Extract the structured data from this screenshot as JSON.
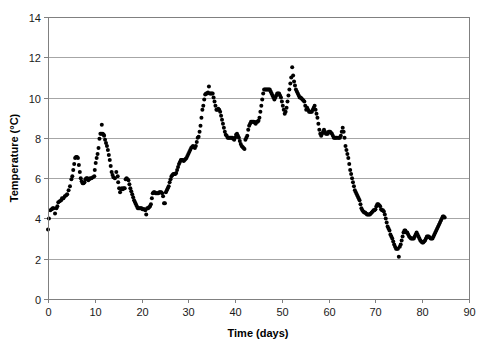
{
  "chart_data": {
    "type": "scatter",
    "title": "",
    "xlabel": "Time (days)",
    "ylabel": "Temperature (°C)",
    "xlim": [
      0,
      90
    ],
    "ylim": [
      0,
      14
    ],
    "x_ticks": [
      0,
      10,
      20,
      30,
      40,
      50,
      60,
      70,
      80,
      90
    ],
    "y_ticks": [
      0,
      2,
      4,
      6,
      8,
      10,
      12,
      14
    ],
    "x_tick_labels": [
      "0",
      "10",
      "20",
      "30",
      "40",
      "50",
      "60",
      "70",
      "80",
      "90"
    ],
    "y_tick_labels": [
      "0",
      "2",
      "4",
      "6",
      "8",
      "10",
      "12",
      "14"
    ],
    "grid": "horizontal",
    "legend": null,
    "marker": "filled-circle",
    "marker_color": "#000000",
    "marker_size": 2.0,
    "series_name": "Temperature",
    "points": [
      [
        0.0,
        3.45
      ],
      [
        0.2,
        4.0
      ],
      [
        0.5,
        4.4
      ],
      [
        0.8,
        4.45
      ],
      [
        1.0,
        4.5
      ],
      [
        1.2,
        4.5
      ],
      [
        1.5,
        4.25
      ],
      [
        1.8,
        4.5
      ],
      [
        2.0,
        4.6
      ],
      [
        2.2,
        4.8
      ],
      [
        2.5,
        4.85
      ],
      [
        2.8,
        4.9
      ],
      [
        3.0,
        5.0
      ],
      [
        3.3,
        5.0
      ],
      [
        3.6,
        5.1
      ],
      [
        3.9,
        5.15
      ],
      [
        4.1,
        5.2
      ],
      [
        4.4,
        5.4
      ],
      [
        4.7,
        5.6
      ],
      [
        5.0,
        5.95
      ],
      [
        5.2,
        6.1
      ],
      [
        5.4,
        6.4
      ],
      [
        5.6,
        6.7
      ],
      [
        5.8,
        7.0
      ],
      [
        6.0,
        7.05
      ],
      [
        6.2,
        7.05
      ],
      [
        6.4,
        7.0
      ],
      [
        6.6,
        6.65
      ],
      [
        6.8,
        6.3
      ],
      [
        7.0,
        6.0
      ],
      [
        7.2,
        5.85
      ],
      [
        7.4,
        5.75
      ],
      [
        7.6,
        5.75
      ],
      [
        7.8,
        5.8
      ],
      [
        8.0,
        5.95
      ],
      [
        8.2,
        6.0
      ],
      [
        8.4,
        6.0
      ],
      [
        8.6,
        5.9
      ],
      [
        8.8,
        5.95
      ],
      [
        9.0,
        6.0
      ],
      [
        9.3,
        6.0
      ],
      [
        9.6,
        6.05
      ],
      [
        9.9,
        6.1
      ],
      [
        10.0,
        6.4
      ],
      [
        10.2,
        6.75
      ],
      [
        10.4,
        7.0
      ],
      [
        10.6,
        7.2
      ],
      [
        10.8,
        7.5
      ],
      [
        11.0,
        7.95
      ],
      [
        11.2,
        8.2
      ],
      [
        11.4,
        8.2
      ],
      [
        11.5,
        8.65
      ],
      [
        11.7,
        8.2
      ],
      [
        11.9,
        8.15
      ],
      [
        12.0,
        8.1
      ],
      [
        12.2,
        7.9
      ],
      [
        12.4,
        7.75
      ],
      [
        12.6,
        7.6
      ],
      [
        12.8,
        7.4
      ],
      [
        13.0,
        7.15
      ],
      [
        13.2,
        6.9
      ],
      [
        13.4,
        6.6
      ],
      [
        13.6,
        6.3
      ],
      [
        13.8,
        6.15
      ],
      [
        14.0,
        6.05
      ],
      [
        14.3,
        6.0
      ],
      [
        14.6,
        6.3
      ],
      [
        14.9,
        6.1
      ],
      [
        15.0,
        5.8
      ],
      [
        15.2,
        5.5
      ],
      [
        15.4,
        5.3
      ],
      [
        15.6,
        5.45
      ],
      [
        15.8,
        5.5
      ],
      [
        16.0,
        5.45
      ],
      [
        16.2,
        5.5
      ],
      [
        16.4,
        5.5
      ],
      [
        16.6,
        5.95
      ],
      [
        16.8,
        6.0
      ],
      [
        17.0,
        5.95
      ],
      [
        17.2,
        5.9
      ],
      [
        17.4,
        5.7
      ],
      [
        17.6,
        5.5
      ],
      [
        17.8,
        5.35
      ],
      [
        18.0,
        5.2
      ],
      [
        18.2,
        5.05
      ],
      [
        18.4,
        4.9
      ],
      [
        18.6,
        4.8
      ],
      [
        18.8,
        4.7
      ],
      [
        19.0,
        4.6
      ],
      [
        19.2,
        4.5
      ],
      [
        19.4,
        4.5
      ],
      [
        19.6,
        4.5
      ],
      [
        19.8,
        4.5
      ],
      [
        20.0,
        4.5
      ],
      [
        20.2,
        4.45
      ],
      [
        20.4,
        4.45
      ],
      [
        20.6,
        4.45
      ],
      [
        20.8,
        4.4
      ],
      [
        21.0,
        4.2
      ],
      [
        21.2,
        4.5
      ],
      [
        21.4,
        4.5
      ],
      [
        21.6,
        4.55
      ],
      [
        21.8,
        4.6
      ],
      [
        22.0,
        4.7
      ],
      [
        22.2,
        5.0
      ],
      [
        22.4,
        5.25
      ],
      [
        22.6,
        5.3
      ],
      [
        22.8,
        5.3
      ],
      [
        23.0,
        5.25
      ],
      [
        23.2,
        5.25
      ],
      [
        23.4,
        5.25
      ],
      [
        23.6,
        5.25
      ],
      [
        23.8,
        5.3
      ],
      [
        24.0,
        5.3
      ],
      [
        24.2,
        5.3
      ],
      [
        24.4,
        5.25
      ],
      [
        24.6,
        5.1
      ],
      [
        24.8,
        4.75
      ],
      [
        25.0,
        4.75
      ],
      [
        25.2,
        5.3
      ],
      [
        25.4,
        5.4
      ],
      [
        25.6,
        5.5
      ],
      [
        25.8,
        5.6
      ],
      [
        26.0,
        5.8
      ],
      [
        26.2,
        5.95
      ],
      [
        26.4,
        6.1
      ],
      [
        26.6,
        6.15
      ],
      [
        26.8,
        6.2
      ],
      [
        27.0,
        6.2
      ],
      [
        27.2,
        6.2
      ],
      [
        27.4,
        6.25
      ],
      [
        27.6,
        6.4
      ],
      [
        27.8,
        6.55
      ],
      [
        28.0,
        6.7
      ],
      [
        28.2,
        6.8
      ],
      [
        28.4,
        6.9
      ],
      [
        28.6,
        6.9
      ],
      [
        28.8,
        6.9
      ],
      [
        29.0,
        6.85
      ],
      [
        29.2,
        6.9
      ],
      [
        29.4,
        6.95
      ],
      [
        29.6,
        7.0
      ],
      [
        29.8,
        7.1
      ],
      [
        30.0,
        7.2
      ],
      [
        30.2,
        7.3
      ],
      [
        30.4,
        7.4
      ],
      [
        30.6,
        7.5
      ],
      [
        30.8,
        7.55
      ],
      [
        31.0,
        7.6
      ],
      [
        31.2,
        7.55
      ],
      [
        31.4,
        7.5
      ],
      [
        31.6,
        7.6
      ],
      [
        31.8,
        7.8
      ],
      [
        32.0,
        8.0
      ],
      [
        32.2,
        8.05
      ],
      [
        32.4,
        8.3
      ],
      [
        32.6,
        8.6
      ],
      [
        32.8,
        9.0
      ],
      [
        33.0,
        9.4
      ],
      [
        33.2,
        9.6
      ],
      [
        33.4,
        9.9
      ],
      [
        33.6,
        10.15
      ],
      [
        33.8,
        10.2
      ],
      [
        34.0,
        10.2
      ],
      [
        34.2,
        10.25
      ],
      [
        34.4,
        10.55
      ],
      [
        34.6,
        10.2
      ],
      [
        34.8,
        10.2
      ],
      [
        35.0,
        10.2
      ],
      [
        35.2,
        10.2
      ],
      [
        35.4,
        10.0
      ],
      [
        35.6,
        9.8
      ],
      [
        35.8,
        9.6
      ],
      [
        36.0,
        9.4
      ],
      [
        36.2,
        9.4
      ],
      [
        36.4,
        9.45
      ],
      [
        36.6,
        9.4
      ],
      [
        36.8,
        9.3
      ],
      [
        37.0,
        9.1
      ],
      [
        37.2,
        8.9
      ],
      [
        37.4,
        8.7
      ],
      [
        37.6,
        8.5
      ],
      [
        37.8,
        8.3
      ],
      [
        38.0,
        8.15
      ],
      [
        38.2,
        8.1
      ],
      [
        38.4,
        8.0
      ],
      [
        38.6,
        8.0
      ],
      [
        38.8,
        8.0
      ],
      [
        39.0,
        8.0
      ],
      [
        39.2,
        8.0
      ],
      [
        39.4,
        8.0
      ],
      [
        39.6,
        7.95
      ],
      [
        39.8,
        7.9
      ],
      [
        40.0,
        8.0
      ],
      [
        40.2,
        8.15
      ],
      [
        40.4,
        8.2
      ],
      [
        40.6,
        8.1
      ],
      [
        40.8,
        8.0
      ],
      [
        41.0,
        7.85
      ],
      [
        41.2,
        7.7
      ],
      [
        41.4,
        7.6
      ],
      [
        41.6,
        7.55
      ],
      [
        41.8,
        7.5
      ],
      [
        42.0,
        7.45
      ],
      [
        42.2,
        7.9
      ],
      [
        42.4,
        8.0
      ],
      [
        42.6,
        8.1
      ],
      [
        42.8,
        8.4
      ],
      [
        43.0,
        8.6
      ],
      [
        43.2,
        8.7
      ],
      [
        43.4,
        8.8
      ],
      [
        43.6,
        8.8
      ],
      [
        43.8,
        8.8
      ],
      [
        44.0,
        8.8
      ],
      [
        44.2,
        8.75
      ],
      [
        44.4,
        8.7
      ],
      [
        44.6,
        8.8
      ],
      [
        44.8,
        8.8
      ],
      [
        45.0,
        8.85
      ],
      [
        45.2,
        9.0
      ],
      [
        45.4,
        9.3
      ],
      [
        45.6,
        9.6
      ],
      [
        45.8,
        9.9
      ],
      [
        46.0,
        10.2
      ],
      [
        46.2,
        10.4
      ],
      [
        46.4,
        10.4
      ],
      [
        46.6,
        10.4
      ],
      [
        46.8,
        10.4
      ],
      [
        47.0,
        10.4
      ],
      [
        47.2,
        10.4
      ],
      [
        47.4,
        10.4
      ],
      [
        47.6,
        10.3
      ],
      [
        47.8,
        10.2
      ],
      [
        48.0,
        10.1
      ],
      [
        48.2,
        10.0
      ],
      [
        48.4,
        9.9
      ],
      [
        48.6,
        10.0
      ],
      [
        48.8,
        10.1
      ],
      [
        49.0,
        10.2
      ],
      [
        49.2,
        10.2
      ],
      [
        49.4,
        10.2
      ],
      [
        49.6,
        10.1
      ],
      [
        49.8,
        10.0
      ],
      [
        50.0,
        9.8
      ],
      [
        50.2,
        9.6
      ],
      [
        50.4,
        9.4
      ],
      [
        50.6,
        9.2
      ],
      [
        50.8,
        9.3
      ],
      [
        51.0,
        9.5
      ],
      [
        51.2,
        9.8
      ],
      [
        51.4,
        10.1
      ],
      [
        51.6,
        10.4
      ],
      [
        51.8,
        10.7
      ],
      [
        52.0,
        11.0
      ],
      [
        52.2,
        11.5
      ],
      [
        52.4,
        11.1
      ],
      [
        52.6,
        10.8
      ],
      [
        52.8,
        10.6
      ],
      [
        53.0,
        10.4
      ],
      [
        53.2,
        10.3
      ],
      [
        53.4,
        10.2
      ],
      [
        53.6,
        10.1
      ],
      [
        53.8,
        10.0
      ],
      [
        54.0,
        10.0
      ],
      [
        54.2,
        9.95
      ],
      [
        54.4,
        9.9
      ],
      [
        54.6,
        9.85
      ],
      [
        54.8,
        9.8
      ],
      [
        55.0,
        9.6
      ],
      [
        55.2,
        9.4
      ],
      [
        55.4,
        9.5
      ],
      [
        55.6,
        9.4
      ],
      [
        55.8,
        9.3
      ],
      [
        56.0,
        9.3
      ],
      [
        56.2,
        9.3
      ],
      [
        56.4,
        9.3
      ],
      [
        56.6,
        9.4
      ],
      [
        56.8,
        9.5
      ],
      [
        57.0,
        9.6
      ],
      [
        57.2,
        9.4
      ],
      [
        57.4,
        9.2
      ],
      [
        57.6,
        9.0
      ],
      [
        57.8,
        8.7
      ],
      [
        58.0,
        8.4
      ],
      [
        58.2,
        8.2
      ],
      [
        58.4,
        8.1
      ],
      [
        58.6,
        8.2
      ],
      [
        58.8,
        8.3
      ],
      [
        59.0,
        8.4
      ],
      [
        59.2,
        8.3
      ],
      [
        59.4,
        8.2
      ],
      [
        59.6,
        8.2
      ],
      [
        59.8,
        8.2
      ],
      [
        60.0,
        8.3
      ],
      [
        60.2,
        8.3
      ],
      [
        60.3,
        8.3
      ],
      [
        60.5,
        8.25
      ],
      [
        60.7,
        8.2
      ],
      [
        60.9,
        8.1
      ],
      [
        61.1,
        8.0
      ],
      [
        61.3,
        8.0
      ],
      [
        61.5,
        8.0
      ],
      [
        61.7,
        8.0
      ],
      [
        62.0,
        8.0
      ],
      [
        62.2,
        8.0
      ],
      [
        62.4,
        8.0
      ],
      [
        62.6,
        8.1
      ],
      [
        62.8,
        8.3
      ],
      [
        63.0,
        8.5
      ],
      [
        63.2,
        8.3
      ],
      [
        63.4,
        8.0
      ],
      [
        63.6,
        7.6
      ],
      [
        63.8,
        7.4
      ],
      [
        64.0,
        7.2
      ],
      [
        64.2,
        7.0
      ],
      [
        64.4,
        6.7
      ],
      [
        64.6,
        6.4
      ],
      [
        64.8,
        6.2
      ],
      [
        65.0,
        6.0
      ],
      [
        65.2,
        5.8
      ],
      [
        65.4,
        5.6
      ],
      [
        65.6,
        5.4
      ],
      [
        65.8,
        5.3
      ],
      [
        66.0,
        5.2
      ],
      [
        66.2,
        5.1
      ],
      [
        66.4,
        5.0
      ],
      [
        66.6,
        4.9
      ],
      [
        66.8,
        4.7
      ],
      [
        67.0,
        4.5
      ],
      [
        67.2,
        4.4
      ],
      [
        67.4,
        4.35
      ],
      [
        67.6,
        4.3
      ],
      [
        67.8,
        4.3
      ],
      [
        68.0,
        4.25
      ],
      [
        68.2,
        4.2
      ],
      [
        68.4,
        4.2
      ],
      [
        68.6,
        4.2
      ],
      [
        68.8,
        4.2
      ],
      [
        69.0,
        4.25
      ],
      [
        69.2,
        4.3
      ],
      [
        69.4,
        4.35
      ],
      [
        69.6,
        4.4
      ],
      [
        69.8,
        4.4
      ],
      [
        70.0,
        4.45
      ],
      [
        70.2,
        4.6
      ],
      [
        70.4,
        4.7
      ],
      [
        70.6,
        4.7
      ],
      [
        70.8,
        4.65
      ],
      [
        71.0,
        4.6
      ],
      [
        71.2,
        4.45
      ],
      [
        71.4,
        4.4
      ],
      [
        71.6,
        4.4
      ],
      [
        71.8,
        4.35
      ],
      [
        72.0,
        4.2
      ],
      [
        72.2,
        4.0
      ],
      [
        72.4,
        3.8
      ],
      [
        72.6,
        3.6
      ],
      [
        72.8,
        3.5
      ],
      [
        73.0,
        3.4
      ],
      [
        73.2,
        3.2
      ],
      [
        73.4,
        3.1
      ],
      [
        73.6,
        3.0
      ],
      [
        73.8,
        2.85
      ],
      [
        74.0,
        2.7
      ],
      [
        74.2,
        2.6
      ],
      [
        74.4,
        2.5
      ],
      [
        74.6,
        2.5
      ],
      [
        74.8,
        2.5
      ],
      [
        75.0,
        2.1
      ],
      [
        75.2,
        2.6
      ],
      [
        75.4,
        2.7
      ],
      [
        75.6,
        2.9
      ],
      [
        75.8,
        3.1
      ],
      [
        76.0,
        3.3
      ],
      [
        76.2,
        3.4
      ],
      [
        76.4,
        3.4
      ],
      [
        76.6,
        3.3
      ],
      [
        76.8,
        3.3
      ],
      [
        77.0,
        3.2
      ],
      [
        77.2,
        3.1
      ],
      [
        77.4,
        3.05
      ],
      [
        77.6,
        3.0
      ],
      [
        77.8,
        3.0
      ],
      [
        78.0,
        3.0
      ],
      [
        78.2,
        3.0
      ],
      [
        78.4,
        3.1
      ],
      [
        78.6,
        3.2
      ],
      [
        78.8,
        3.3
      ],
      [
        79.0,
        3.2
      ],
      [
        79.2,
        3.1
      ],
      [
        79.4,
        3.0
      ],
      [
        79.6,
        2.9
      ],
      [
        79.8,
        2.85
      ],
      [
        80.0,
        2.8
      ],
      [
        80.2,
        2.8
      ],
      [
        80.4,
        2.85
      ],
      [
        80.6,
        2.9
      ],
      [
        80.8,
        3.0
      ],
      [
        81.0,
        3.1
      ],
      [
        81.2,
        3.1
      ],
      [
        81.4,
        3.1
      ],
      [
        81.6,
        3.05
      ],
      [
        81.8,
        3.0
      ],
      [
        82.0,
        3.0
      ],
      [
        82.2,
        3.0
      ],
      [
        82.4,
        3.1
      ],
      [
        82.6,
        3.2
      ],
      [
        82.8,
        3.3
      ],
      [
        83.0,
        3.4
      ],
      [
        83.2,
        3.5
      ],
      [
        83.4,
        3.6
      ],
      [
        83.6,
        3.7
      ],
      [
        83.8,
        3.8
      ],
      [
        84.0,
        3.9
      ],
      [
        84.2,
        4.0
      ],
      [
        84.4,
        4.1
      ],
      [
        84.6,
        4.1
      ],
      [
        84.8,
        4.05
      ]
    ]
  },
  "axes": {
    "x_title": "Time (days)",
    "y_title": "Temperature (°C)"
  },
  "colors": {
    "marker": "#000000",
    "grid": "#a6a6a6",
    "frame": "#808080",
    "background": "#ffffff",
    "text": "#000000"
  }
}
